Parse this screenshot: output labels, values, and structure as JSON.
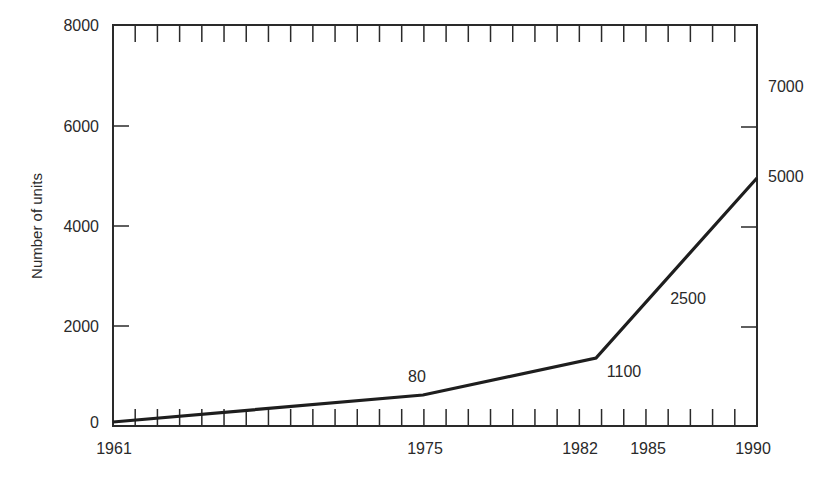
{
  "chart_data": {
    "type": "line",
    "title": "",
    "xlabel": "",
    "ylabel": "Number of units",
    "ylim": [
      0,
      8000
    ],
    "xlim": [
      1961,
      1990
    ],
    "grid": false,
    "legend": null,
    "x_tick_labels": [
      "1961",
      "1975",
      "1982",
      "1985",
      "1990"
    ],
    "y_tick_labels_left": [
      "0",
      "2000",
      "4000",
      "6000",
      "8000"
    ],
    "y_tick_labels_right": [
      "7000",
      "5000"
    ],
    "series": [
      {
        "name": "Number of units",
        "x": [
          1961,
          1975,
          1982.5,
          1990
        ],
        "values": [
          60,
          600,
          1320,
          4950
        ]
      }
    ],
    "annotations": [
      {
        "text": "80",
        "x": 1975,
        "note": "label above 1975 point"
      },
      {
        "text": "1100",
        "x": 1983.5,
        "note": "label below 1982 vertex"
      },
      {
        "text": "2500",
        "x": 1987,
        "note": "label beside rising segment"
      },
      {
        "text": "5000",
        "x": 1990,
        "note": "label at right end of line"
      },
      {
        "text": "7000",
        "x": 1990,
        "note": "right-side label near top"
      }
    ]
  },
  "labels": {
    "ylabel": "Number of units",
    "y_left": {
      "y0": "0",
      "y2000": "2000",
      "y4000": "4000",
      "y6000": "6000",
      "y8000": "8000"
    },
    "y_right": {
      "r7000": "7000",
      "r5000": "5000"
    },
    "x": {
      "x1961": "1961",
      "x1975": "1975",
      "x1982": "1982",
      "x1985": "1985",
      "x1990": "1990"
    },
    "annot": {
      "a80": "80",
      "a1100": "1100",
      "a2500": "2500"
    }
  },
  "colors": {
    "ink": "#2a2a2a",
    "background": "#ffffff"
  }
}
